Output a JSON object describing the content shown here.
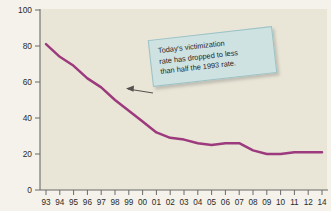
{
  "chart_data": {
    "type": "line",
    "title": "",
    "xlabel": "",
    "ylabel": "Rate per 1,000 persons age 12 or older",
    "ylim": [
      0,
      100
    ],
    "yticks": [
      0,
      20,
      40,
      60,
      80,
      100
    ],
    "grid": false,
    "legend": null,
    "line_color": "#9c3a7d",
    "plot_background": "#e9e6d7",
    "categories": [
      "93",
      "94",
      "95",
      "96",
      "97",
      "98",
      "99",
      "00",
      "01",
      "02",
      "03",
      "04",
      "05",
      "06",
      "07",
      "08",
      "09",
      "10",
      "11",
      "12",
      "14"
    ],
    "x": [
      "93",
      "94",
      "95",
      "96",
      "97",
      "98",
      "99",
      "00",
      "01",
      "02",
      "03",
      "04",
      "05",
      "06",
      "07",
      "08",
      "09",
      "10",
      "11",
      "12",
      "14"
    ],
    "values": [
      81,
      74,
      69,
      62,
      57,
      50,
      44,
      38,
      32,
      29,
      28,
      26,
      25,
      26,
      26,
      22,
      20,
      20,
      21,
      21,
      21
    ],
    "series": [
      {
        "name": "Violent victimization rate",
        "values": [
          81,
          74,
          69,
          62,
          57,
          50,
          44,
          38,
          32,
          29,
          28,
          26,
          25,
          26,
          26,
          22,
          20,
          20,
          21,
          21,
          21
        ]
      }
    ],
    "annotations": [
      {
        "text": "Today's victimization rate has dropped to less than half the 1993 rate.",
        "points_to_year": "97",
        "points_to_value": 57,
        "box_color": "#cfe2e2"
      }
    ]
  },
  "axis": {
    "y_label": "Rate per 1,000 persons age 12 or older",
    "y_tick_labels": [
      "100",
      "80",
      "60",
      "40",
      "20",
      "0"
    ],
    "x_tick_labels": [
      "93",
      "94",
      "95",
      "96",
      "97",
      "98",
      "99",
      "00",
      "01",
      "02",
      "03",
      "04",
      "05",
      "06",
      "07",
      "08",
      "09",
      "10",
      "11",
      "12",
      "14"
    ]
  },
  "callout": {
    "line1": "Today's victimization",
    "line2": "rate has dropped to less",
    "line3": "than half the 1993 rate."
  }
}
